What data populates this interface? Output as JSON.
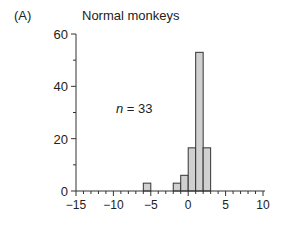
{
  "panel_label": "(A)",
  "title": "Normal monkeys",
  "annotation": {
    "var": "n",
    "eq": " = 33"
  },
  "colors": {
    "bar_fill": "#d0d0d0",
    "bar_stroke": "#333333",
    "axis": "#333333"
  },
  "chart_data": {
    "type": "bar",
    "title": "Normal monkeys",
    "xlabel": "",
    "ylabel": "",
    "bin_width": 1,
    "bins": [
      {
        "x0": -6,
        "x1": -5,
        "value": 3
      },
      {
        "x0": -2,
        "x1": -1,
        "value": 3
      },
      {
        "x0": -1,
        "x1": 0,
        "value": 6
      },
      {
        "x0": 0,
        "x1": 1,
        "value": 16.5
      },
      {
        "x0": 1,
        "x1": 2,
        "value": 53
      },
      {
        "x0": 2,
        "x1": 3,
        "value": 16.5
      }
    ],
    "xlim": [
      -15,
      10
    ],
    "ylim": [
      0,
      60
    ],
    "xticks": [
      -15,
      -10,
      -5,
      0,
      5,
      10
    ],
    "xtick_labels": [
      "−15",
      "−10",
      "−5",
      "0",
      "5",
      "10"
    ],
    "yticks": [
      0,
      20,
      40,
      60
    ],
    "ytick_labels": [
      "0",
      "20",
      "40",
      "60"
    ],
    "annotations": [
      "n = 33"
    ],
    "grid": false,
    "legend": null
  }
}
